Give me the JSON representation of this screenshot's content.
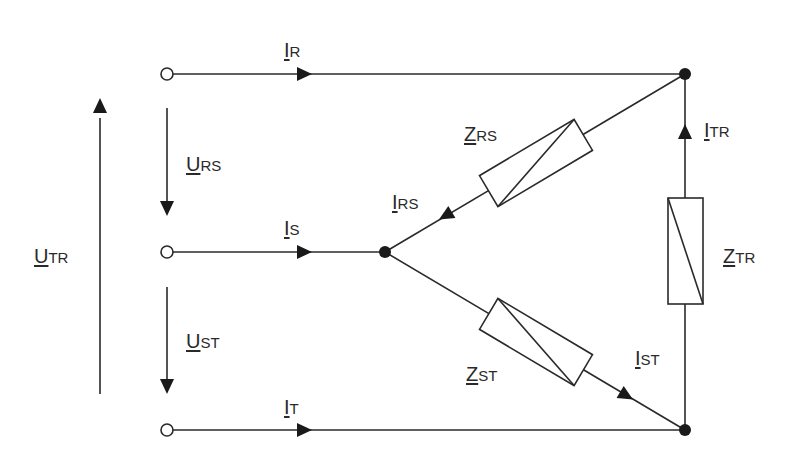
{
  "diagram": {
    "type": "delta-connection circuit",
    "colors": {
      "line": "#2a2a2a",
      "background": "#ffffff"
    },
    "terminals": [
      {
        "id": "R",
        "x": 167,
        "y": 74
      },
      {
        "id": "S",
        "x": 167,
        "y": 252
      },
      {
        "id": "T",
        "x": 167,
        "y": 430
      }
    ],
    "labels": {
      "I_R": {
        "main": "I",
        "sub": "R"
      },
      "I_S": {
        "main": "I",
        "sub": "S"
      },
      "I_T": {
        "main": "I",
        "sub": "T"
      },
      "U_RS": {
        "main": "U",
        "sub": "RS"
      },
      "U_ST": {
        "main": "U",
        "sub": "ST"
      },
      "U_TR": {
        "main": "U",
        "sub": "TR"
      },
      "Z_RS": {
        "main": "Z",
        "sub": "RS"
      },
      "Z_ST": {
        "main": "Z",
        "sub": "ST"
      },
      "Z_TR": {
        "main": "Z",
        "sub": "TR"
      },
      "I_RS": {
        "main": "I",
        "sub": "RS"
      },
      "I_ST": {
        "main": "I",
        "sub": "ST"
      },
      "I_TR": {
        "main": "I",
        "sub": "TR"
      }
    }
  }
}
